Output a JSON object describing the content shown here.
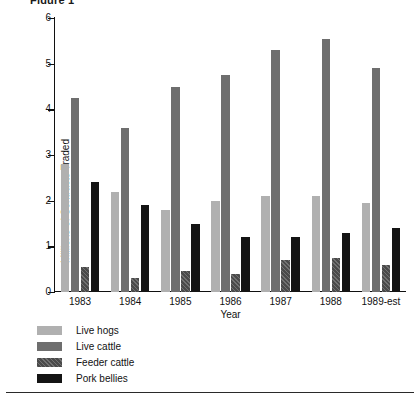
{
  "title_fragment": "Figure 1",
  "chart_data": {
    "type": "bar",
    "title": "",
    "xlabel": "Year",
    "ylabel": "Millions of Contracts Traded",
    "categories": [
      "1983",
      "1984",
      "1985",
      "1986",
      "1987",
      "1988",
      "1989-est"
    ],
    "ylim": [
      0,
      6
    ],
    "yticks": [
      "0",
      "1",
      "2",
      "3",
      "4",
      "5",
      "6"
    ],
    "grid": false,
    "legend_position": "below-left",
    "series": [
      {
        "name": "Live hogs",
        "color": "#b0b0b0",
        "values": [
          2.8,
          2.2,
          1.8,
          2.0,
          2.1,
          2.1,
          1.95
        ]
      },
      {
        "name": "Live cattle",
        "color": "#6e6e6e",
        "values": [
          4.25,
          3.6,
          4.5,
          4.75,
          5.3,
          5.55,
          4.9
        ]
      },
      {
        "name": "Feeder cattle",
        "color": "#4a4a4a",
        "values": [
          0.55,
          0.3,
          0.45,
          0.4,
          0.7,
          0.75,
          0.6
        ]
      },
      {
        "name": "Pork bellies",
        "color": "#141414",
        "values": [
          2.4,
          1.9,
          1.5,
          1.2,
          1.2,
          1.3,
          1.4
        ]
      }
    ]
  }
}
